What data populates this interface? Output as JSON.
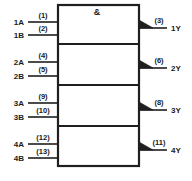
{
  "diagram": {
    "symbol_qualifier": "&",
    "line_color": "#1f1f1f",
    "background_color": "#ffffff",
    "box": {
      "x": 58,
      "y": 5,
      "width": 81,
      "height": 161
    },
    "dividers_y": [
      44,
      85,
      126
    ],
    "gates": [
      {
        "id": "gate-1",
        "inputs": [
          {
            "name": "1A",
            "pin": "(1)",
            "y": 22,
            "wire_x1": 28,
            "wire_x2": 58
          },
          {
            "name": "1B",
            "pin": "(2)",
            "y": 35,
            "wire_x1": 28,
            "wire_x2": 58
          }
        ],
        "output": {
          "name": "1Y",
          "pin": "(3)",
          "y": 28,
          "wire_x1": 139,
          "wire_x2": 167
        }
      },
      {
        "id": "gate-2",
        "inputs": [
          {
            "name": "2A",
            "pin": "(4)",
            "y": 62,
            "wire_x1": 28,
            "wire_x2": 58
          },
          {
            "name": "2B",
            "pin": "(5)",
            "y": 76,
            "wire_x1": 28,
            "wire_x2": 58
          }
        ],
        "output": {
          "name": "2Y",
          "pin": "(6)",
          "y": 68,
          "wire_x1": 139,
          "wire_x2": 167
        }
      },
      {
        "id": "gate-3",
        "inputs": [
          {
            "name": "3A",
            "pin": "(9)",
            "y": 103,
            "wire_x1": 28,
            "wire_x2": 58
          },
          {
            "name": "3B",
            "pin": "(10)",
            "y": 117,
            "wire_x1": 28,
            "wire_x2": 58
          }
        ],
        "output": {
          "name": "3Y",
          "pin": "(8)",
          "y": 110,
          "wire_x1": 139,
          "wire_x2": 167
        }
      },
      {
        "id": "gate-4",
        "inputs": [
          {
            "name": "4A",
            "pin": "(12)",
            "y": 144,
            "wire_x1": 28,
            "wire_x2": 58
          },
          {
            "name": "4B",
            "pin": "(13)",
            "y": 158,
            "wire_x1": 28,
            "wire_x2": 58
          }
        ],
        "output": {
          "name": "4Y",
          "pin": "(11)",
          "y": 150,
          "wire_x1": 139,
          "wire_x2": 167
        }
      }
    ]
  }
}
